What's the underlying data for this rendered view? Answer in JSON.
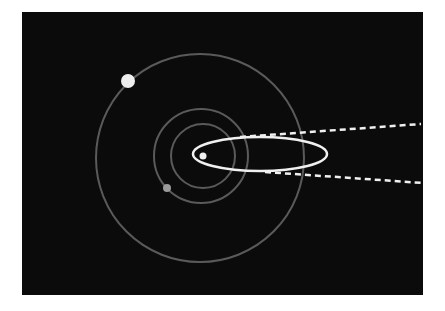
{
  "diagram": {
    "background_color": "#0b0b0b",
    "orbit_color": "#5a5a5a",
    "highlight_color": "#f0f0f0",
    "sun": {
      "cx": 203,
      "cy": 156,
      "r": 3.5
    },
    "orbits": [
      {
        "name": "inner-orbit",
        "cx": 203,
        "cy": 156,
        "r": 32
      },
      {
        "name": "middle-orbit",
        "cx": 201,
        "cy": 156,
        "r": 47
      },
      {
        "name": "outer-orbit",
        "cx": 200,
        "cy": 158,
        "r": 104
      }
    ],
    "planets": [
      {
        "name": "outer-planet",
        "cx": 128,
        "cy": 81,
        "r": 7
      },
      {
        "name": "middle-planet",
        "cx": 167,
        "cy": 188,
        "r": 4
      }
    ],
    "comet_orbit": {
      "cx": 260,
      "cy": 154,
      "rx": 67,
      "ry": 17
    },
    "dashed_lines": [
      {
        "name": "upper-trajectory",
        "x1": 240,
        "y1": 137,
        "x2": 421,
        "y2": 124
      },
      {
        "name": "lower-trajectory",
        "x1": 265,
        "y1": 172,
        "x2": 423,
        "y2": 183
      }
    ]
  }
}
